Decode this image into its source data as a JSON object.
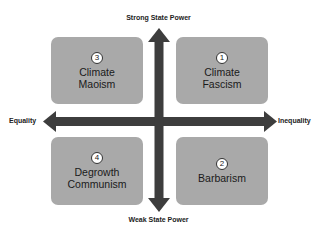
{
  "diagram": {
    "axes": {
      "top": "Strong State Power",
      "bottom": "Weak State Power",
      "left": "Equality",
      "right": "Inequality"
    },
    "quadrants": [
      {
        "position": "top-left",
        "number": "3",
        "label": "Climate\nMaoism"
      },
      {
        "position": "top-right",
        "number": "1",
        "label": "Climate\nFascism"
      },
      {
        "position": "bottom-left",
        "number": "4",
        "label": "Degrowth\nCommunism"
      },
      {
        "position": "bottom-right",
        "number": "2",
        "label": "Barbarism"
      }
    ],
    "colors": {
      "box": "#a9a9a9",
      "arrow": "#3d3d3d",
      "text": "#1a1a1a"
    }
  }
}
